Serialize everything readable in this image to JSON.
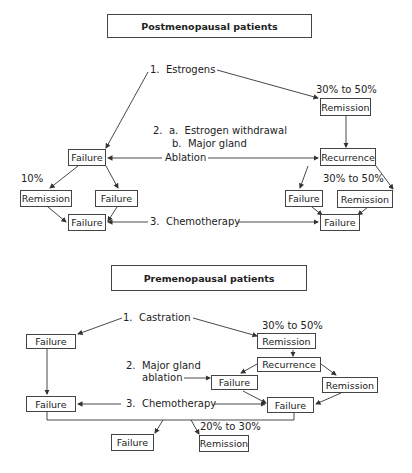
{
  "post": {
    "title": "Postmenopausal patients",
    "step1": "1.  Estrogens",
    "step2a": "2.  a.  Estrogen withdrawal",
    "step2b": "b.  Major gland",
    "step2c": "Ablation",
    "step3": "3.  Chemotherapy",
    "pct_top": "30% to 50%",
    "pct_left": "10%",
    "pct_right": "30% to 50%",
    "boxes": {
      "remission_top": "Remission",
      "failure_left": "Failure",
      "recurrence": "Recurrence",
      "remission_left": "Remission",
      "failure_mid": "Failure",
      "failure_bottom_left": "Failure",
      "failure_right": "Failure",
      "remission_right": "Remission",
      "failure_bottom_right": "Failure"
    }
  },
  "pre": {
    "title": "Premenopausal patients",
    "step1": "1.  Castration",
    "step2a": "2.  Major gland",
    "step2b": "ablation",
    "step3": "3.  Chemotherapy",
    "pct_top": "30% to 50%",
    "pct_bottom": "20% to 30%",
    "boxes": {
      "failure_top_left": "Failure",
      "remission_top": "Remission",
      "recurrence": "Recurrence",
      "failure_mid": "Failure",
      "remission_right": "Remission",
      "failure_left": "Failure",
      "failure_center": "Failure",
      "failure_bottom": "Failure",
      "remission_bottom": "Remission"
    }
  }
}
